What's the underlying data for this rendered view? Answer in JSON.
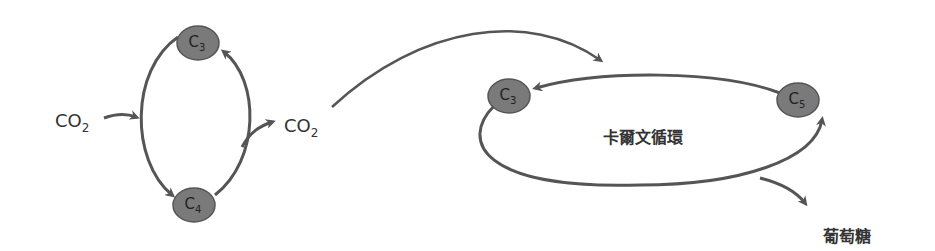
{
  "colors": {
    "line": "#555555",
    "node_fill": "#7a7a7a",
    "node_stroke": "#555555",
    "text": "#333333"
  },
  "left_cycle": {
    "input": {
      "main": "CO",
      "sub": "2"
    },
    "output": {
      "main": "CO",
      "sub": "2"
    },
    "nodes": [
      {
        "id": "c3-top",
        "main": "C",
        "sub": "3"
      },
      {
        "id": "c4-bottom",
        "main": "C",
        "sub": "4"
      }
    ]
  },
  "calvin_cycle": {
    "label": "卡爾文循環",
    "nodes": [
      {
        "id": "c3",
        "main": "C",
        "sub": "3"
      },
      {
        "id": "c5",
        "main": "C",
        "sub": "5"
      }
    ],
    "product": "葡萄糖"
  }
}
